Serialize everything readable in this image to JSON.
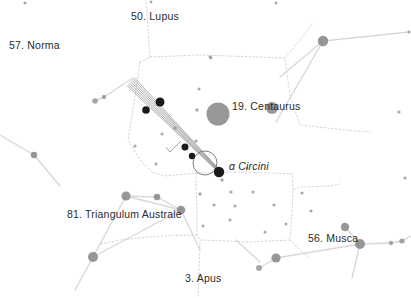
{
  "chart_data": {
    "type": "scatter",
    "xlabel": "",
    "ylabel": "",
    "xlim": [
      0,
      411
    ],
    "ylim": [
      0,
      298
    ],
    "grid": false,
    "legend": "none",
    "background_color": "#ffffff",
    "star_color": "#8c8c8c",
    "highlight_color": "#1a1a1a",
    "line_color": "#d8d8d8",
    "boundary_color": "#c9c9c9",
    "text_color": "#2b2b2b",
    "constellation_labels": [
      {
        "id": "lupus",
        "text": "50. Lupus",
        "x": 131,
        "y": 11,
        "italic": false
      },
      {
        "id": "norma",
        "text": "57. Norma",
        "x": 9,
        "y": 40,
        "italic": false
      },
      {
        "id": "centaurus",
        "text": "19. Centaurus",
        "x": 232,
        "y": 101,
        "italic": false
      },
      {
        "id": "circini",
        "text": "α Circini",
        "x": 229,
        "y": 161,
        "italic": true
      },
      {
        "id": "tra",
        "text": "81. Triangulum Australe",
        "x": 67,
        "y": 209,
        "italic": false
      },
      {
        "id": "musca",
        "text": "56. Musca",
        "x": 308,
        "y": 233,
        "italic": false
      },
      {
        "id": "apus",
        "text": "3. Apus",
        "x": 185,
        "y": 273,
        "italic": false
      }
    ],
    "stars": [
      {
        "x": 95,
        "y": 101,
        "r": 2.8,
        "mag": "faint"
      },
      {
        "x": 104,
        "y": 97,
        "r": 2.2,
        "mag": "faint"
      },
      {
        "x": 25,
        "y": 3,
        "r": 1.6,
        "mag": "faint"
      },
      {
        "x": 151,
        "y": 2,
        "r": 1.4,
        "mag": "faint"
      },
      {
        "x": 276,
        "y": 3,
        "r": 1.5,
        "mag": "faint"
      },
      {
        "x": 323,
        "y": 41,
        "r": 5.2,
        "mag": "bright"
      },
      {
        "x": 210,
        "y": 57,
        "r": 1.5,
        "mag": "faint"
      },
      {
        "x": 211,
        "y": 58,
        "r": 1.4,
        "mag": "faint"
      },
      {
        "x": 409,
        "y": 32,
        "r": 1.6,
        "mag": "faint"
      },
      {
        "x": 218,
        "y": 114,
        "r": 11.5,
        "mag": "bright"
      },
      {
        "x": 272,
        "y": 108,
        "r": 6.0,
        "mag": "bright"
      },
      {
        "x": 197,
        "y": 110,
        "r": 1.7,
        "mag": "faint"
      },
      {
        "x": 199,
        "y": 89,
        "r": 1.5,
        "mag": "faint"
      },
      {
        "x": 196,
        "y": 141,
        "r": 1.6,
        "mag": "faint"
      },
      {
        "x": 175,
        "y": 128,
        "r": 1.7,
        "mag": "faint"
      },
      {
        "x": 162,
        "y": 134,
        "r": 1.6,
        "mag": "faint"
      },
      {
        "x": 146,
        "y": 110,
        "r": 1.6,
        "mag": "faint"
      },
      {
        "x": 135,
        "y": 146,
        "r": 1.6,
        "mag": "faint"
      },
      {
        "x": 156,
        "y": 164,
        "r": 1.6,
        "mag": "faint"
      },
      {
        "x": 34,
        "y": 155,
        "r": 3.2,
        "mag": "faint"
      },
      {
        "x": 126,
        "y": 196,
        "r": 4.6,
        "mag": "faint"
      },
      {
        "x": 157,
        "y": 197,
        "r": 3.3,
        "mag": "faint"
      },
      {
        "x": 181,
        "y": 210,
        "r": 4.3,
        "mag": "faint"
      },
      {
        "x": 93,
        "y": 257,
        "r": 5.0,
        "mag": "faint"
      },
      {
        "x": 222,
        "y": 180,
        "r": 1.7,
        "mag": "faint"
      },
      {
        "x": 200,
        "y": 194,
        "r": 1.7,
        "mag": "faint"
      },
      {
        "x": 231,
        "y": 192,
        "r": 1.6,
        "mag": "faint"
      },
      {
        "x": 253,
        "y": 192,
        "r": 1.6,
        "mag": "faint"
      },
      {
        "x": 235,
        "y": 206,
        "r": 1.6,
        "mag": "faint"
      },
      {
        "x": 214,
        "y": 205,
        "r": 1.6,
        "mag": "faint"
      },
      {
        "x": 274,
        "y": 205,
        "r": 1.6,
        "mag": "faint"
      },
      {
        "x": 230,
        "y": 220,
        "r": 1.5,
        "mag": "faint"
      },
      {
        "x": 247,
        "y": 168,
        "r": 1.5,
        "mag": "faint"
      },
      {
        "x": 203,
        "y": 226,
        "r": 1.5,
        "mag": "faint"
      },
      {
        "x": 265,
        "y": 232,
        "r": 1.5,
        "mag": "faint"
      },
      {
        "x": 286,
        "y": 224,
        "r": 1.5,
        "mag": "faint"
      },
      {
        "x": 302,
        "y": 193,
        "r": 1.6,
        "mag": "faint"
      },
      {
        "x": 345,
        "y": 227,
        "r": 4.2,
        "mag": "faint"
      },
      {
        "x": 360,
        "y": 244,
        "r": 5.0,
        "mag": "faint"
      },
      {
        "x": 276,
        "y": 258,
        "r": 4.6,
        "mag": "faint"
      },
      {
        "x": 259,
        "y": 268,
        "r": 3.0,
        "mag": "faint"
      },
      {
        "x": 391,
        "y": 243,
        "r": 2.2,
        "mag": "faint"
      },
      {
        "x": 402,
        "y": 241,
        "r": 2.6,
        "mag": "faint"
      },
      {
        "x": 311,
        "y": 211,
        "r": 1.6,
        "mag": "faint"
      },
      {
        "x": 399,
        "y": 112,
        "r": 1.6,
        "mag": "faint"
      },
      {
        "x": 405,
        "y": 178,
        "r": 1.6,
        "mag": "faint"
      }
    ],
    "comet_track_stars": [
      {
        "x": 160,
        "y": 102,
        "r": 4.5
      },
      {
        "x": 146,
        "y": 110,
        "r": 3.8
      },
      {
        "x": 185,
        "y": 147,
        "r": 3.5
      },
      {
        "x": 192,
        "y": 156,
        "r": 3.2
      },
      {
        "x": 219,
        "y": 172,
        "r": 5.2
      }
    ],
    "comet_track": {
      "start": [
        131,
        82
      ],
      "end": [
        222,
        174
      ],
      "marker_circle": {
        "x": 205,
        "y": 163,
        "r": 12
      },
      "rays": 7
    },
    "constellation_lines": [
      [
        [
          95,
          101
        ],
        [
          104,
          97
        ]
      ],
      [
        [
          104,
          97
        ],
        [
          133,
          78
        ]
      ],
      [
        [
          323,
          41
        ],
        [
          280,
          77
        ]
      ],
      [
        [
          323,
          41
        ],
        [
          409,
          32
        ]
      ],
      [
        [
          323,
          41
        ],
        [
          276,
          122
        ]
      ],
      [
        [
          34,
          155
        ],
        [
          0,
          135
        ]
      ],
      [
        [
          34,
          155
        ],
        [
          60,
          186
        ]
      ],
      [
        [
          126,
          196
        ],
        [
          181,
          210
        ]
      ],
      [
        [
          126,
          196
        ],
        [
          93,
          257
        ]
      ],
      [
        [
          181,
          210
        ],
        [
          93,
          257
        ]
      ],
      [
        [
          126,
          196
        ],
        [
          157,
          197
        ]
      ],
      [
        [
          157,
          197
        ],
        [
          181,
          210
        ]
      ],
      [
        [
          93,
          257
        ],
        [
          75,
          290
        ]
      ],
      [
        [
          181,
          210
        ],
        [
          200,
          250
        ]
      ],
      [
        [
          345,
          227
        ],
        [
          360,
          244
        ]
      ],
      [
        [
          360,
          244
        ],
        [
          391,
          243
        ]
      ],
      [
        [
          391,
          243
        ],
        [
          402,
          241
        ]
      ],
      [
        [
          402,
          241
        ],
        [
          411,
          236
        ]
      ],
      [
        [
          360,
          244
        ],
        [
          276,
          258
        ]
      ],
      [
        [
          276,
          258
        ],
        [
          259,
          268
        ]
      ],
      [
        [
          360,
          244
        ],
        [
          352,
          278
        ]
      ],
      [
        [
          260,
          262
        ],
        [
          236,
          240
        ]
      ]
    ],
    "boundaries": [
      [
        [
          140,
          62
        ],
        [
          150,
          57
        ],
        [
          200,
          55
        ],
        [
          285,
          58
        ],
        [
          290,
          96
        ],
        [
          300,
          125
        ],
        [
          345,
          130
        ],
        [
          370,
          132
        ]
      ],
      [
        [
          140,
          62
        ],
        [
          133,
          110
        ],
        [
          128,
          140
        ],
        [
          140,
          160
        ],
        [
          152,
          172
        ],
        [
          165,
          176
        ],
        [
          196,
          173
        ]
      ],
      [
        [
          196,
          173
        ],
        [
          196,
          186
        ],
        [
          197,
          210
        ],
        [
          197,
          235
        ],
        [
          200,
          240
        ],
        [
          250,
          242
        ],
        [
          290,
          240
        ],
        [
          292,
          215
        ],
        [
          293,
          190
        ],
        [
          300,
          187
        ],
        [
          330,
          186
        ],
        [
          340,
          184
        ]
      ],
      [
        [
          196,
          173
        ],
        [
          232,
          172
        ],
        [
          270,
          173
        ],
        [
          292,
          174
        ],
        [
          293,
          190
        ]
      ],
      [
        [
          197,
          235
        ],
        [
          160,
          236
        ],
        [
          120,
          240
        ],
        [
          100,
          244
        ]
      ],
      [
        [
          200,
          242
        ],
        [
          199,
          270
        ],
        [
          198,
          296
        ]
      ],
      [
        [
          150,
          57
        ],
        [
          148,
          30
        ],
        [
          147,
          10
        ],
        [
          146,
          0
        ]
      ],
      [
        [
          285,
          58
        ],
        [
          300,
          40
        ],
        [
          312,
          24
        ]
      ],
      [
        [
          290,
          240
        ],
        [
          300,
          250
        ],
        [
          310,
          258
        ]
      ]
    ]
  }
}
